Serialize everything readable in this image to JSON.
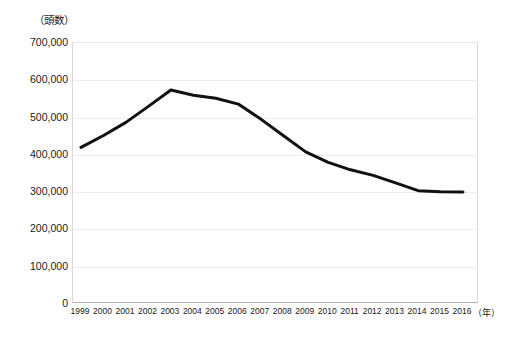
{
  "chart_data": {
    "type": "line",
    "title": "",
    "subtitle": "",
    "xlabel": "（年）",
    "ylabel": "（頭数）",
    "grid": true,
    "legend": false,
    "xlim": [
      1999,
      2016
    ],
    "ylim": [
      0,
      700000
    ],
    "y_ticks": [
      700000,
      600000,
      500000,
      400000,
      300000,
      200000,
      100000,
      0
    ],
    "y_tick_labels": [
      "700,000",
      "600,000",
      "500,000",
      "400,000",
      "300,000",
      "200,000",
      "100,000",
      "0"
    ],
    "categories": [
      "1999",
      "2000",
      "2001",
      "2002",
      "2003",
      "2004",
      "2005",
      "2006",
      "2007",
      "2008",
      "2009",
      "2010",
      "2011",
      "2012",
      "2013",
      "2014",
      "2015",
      "2016"
    ],
    "series": [
      {
        "name": "頭数",
        "color": "#111111",
        "line_width": 3,
        "values": [
          420000,
          452000,
          487000,
          530000,
          574000,
          560000,
          552000,
          536000,
          496000,
          452000,
          408000,
          380000,
          360000,
          345000,
          325000,
          304000,
          301000,
          300000
        ]
      }
    ]
  },
  "axis": {
    "y_unit_label": "（頭数）",
    "x_unit_label": "（年）"
  }
}
